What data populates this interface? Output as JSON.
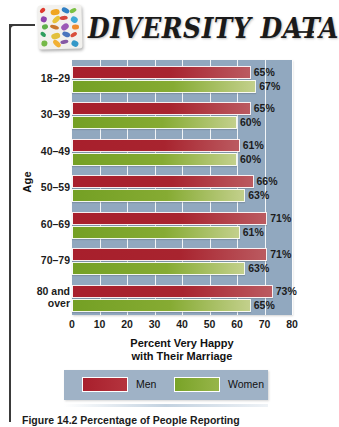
{
  "header": {
    "title": "DIVERSITY DATA",
    "logo_name": "mosaic-logo",
    "logo_tiles": [
      "#e03a2f",
      "#f0a522",
      "#2f7fc4",
      "#7ac143",
      "#8e44ad",
      "#e8c33a",
      "#d6453c",
      "#3fa9d6",
      "#5fb04a",
      "#c9772e",
      "#9b59b6",
      "#ef8b2c",
      "#2f9e5e",
      "#e2c03b",
      "#4a74bd",
      "#d94f3d",
      "#76b948",
      "#f2b134",
      "#8659a5",
      "#3498c8"
    ]
  },
  "chart_data": {
    "type": "bar",
    "orientation": "horizontal",
    "title": "",
    "xlabel": "Percent Very Happy with Their Marriage",
    "ylabel": "Age",
    "xlim": [
      0,
      80
    ],
    "xticks": [
      0,
      10,
      20,
      30,
      40,
      50,
      60,
      70,
      80
    ],
    "xtick_labels": [
      "0",
      "10",
      "20",
      "30",
      "40",
      "50",
      "60",
      "70",
      "80"
    ],
    "grid": true,
    "legend_position": "bottom",
    "categories": [
      "18–29",
      "30–39",
      "40–49",
      "50–59",
      "60–69",
      "70–79",
      "80 and over"
    ],
    "series": [
      {
        "name": "Men",
        "color": "#a81f2c",
        "values": [
          65,
          65,
          61,
          66,
          71,
          71,
          73
        ]
      },
      {
        "name": "Women",
        "color": "#7da62b",
        "values": [
          67,
          60,
          60,
          63,
          61,
          63,
          65
        ]
      }
    ],
    "value_labels": {
      "men": [
        "65%",
        "65%",
        "61%",
        "66%",
        "71%",
        "71%",
        "73%"
      ],
      "women": [
        "67%",
        "60%",
        "60%",
        "63%",
        "61%",
        "63%",
        "65%"
      ]
    },
    "plot_background": "#91a8bf"
  },
  "axis": {
    "x_title_line1": "Percent Very Happy",
    "x_title_line2": "with Their Marriage",
    "y_title": "Age"
  },
  "legend": {
    "items": [
      {
        "label": "Men",
        "color": "#a81f2c"
      },
      {
        "label": "Women",
        "color": "#7da62b"
      }
    ]
  },
  "caption": {
    "text": "Figure 14.2   Percentage of People Reporting"
  }
}
